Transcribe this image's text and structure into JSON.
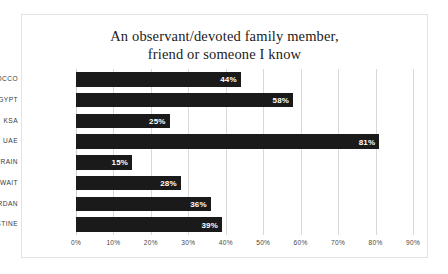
{
  "figure": {
    "background_color": "#ffffff",
    "border_color": "#e3e3e3"
  },
  "chart_data": {
    "type": "bar",
    "orientation": "horizontal",
    "title": "An observant/devoted family member, friend or someone I know",
    "title_lines": [
      "An observant/devoted family member,",
      "friend or someone I know"
    ],
    "xlabel": "",
    "ylabel": "",
    "categories": [
      "MOROCCO",
      "EGYPT",
      "KSA",
      "UAE",
      "BAHRAIN",
      "KUWAIT",
      "JORDAN",
      "PALESTINE"
    ],
    "values": [
      44,
      58,
      25,
      81,
      15,
      28,
      36,
      39
    ],
    "data_labels": [
      "44%",
      "58%",
      "25%",
      "81%",
      "15%",
      "28%",
      "36%",
      "39%"
    ],
    "xlim": [
      0,
      90
    ],
    "xticks": [
      0,
      10,
      20,
      30,
      40,
      50,
      60,
      70,
      80,
      90
    ],
    "xtick_labels": [
      "0%",
      "10%",
      "20%",
      "30%",
      "40%",
      "50%",
      "60%",
      "70%",
      "80%",
      "90%"
    ],
    "grid": true,
    "grid_axis": "x",
    "grid_color": "#d9d9d9",
    "legend": false,
    "bar_color": "#1a1a1a",
    "data_label_color": "#ffffff"
  }
}
